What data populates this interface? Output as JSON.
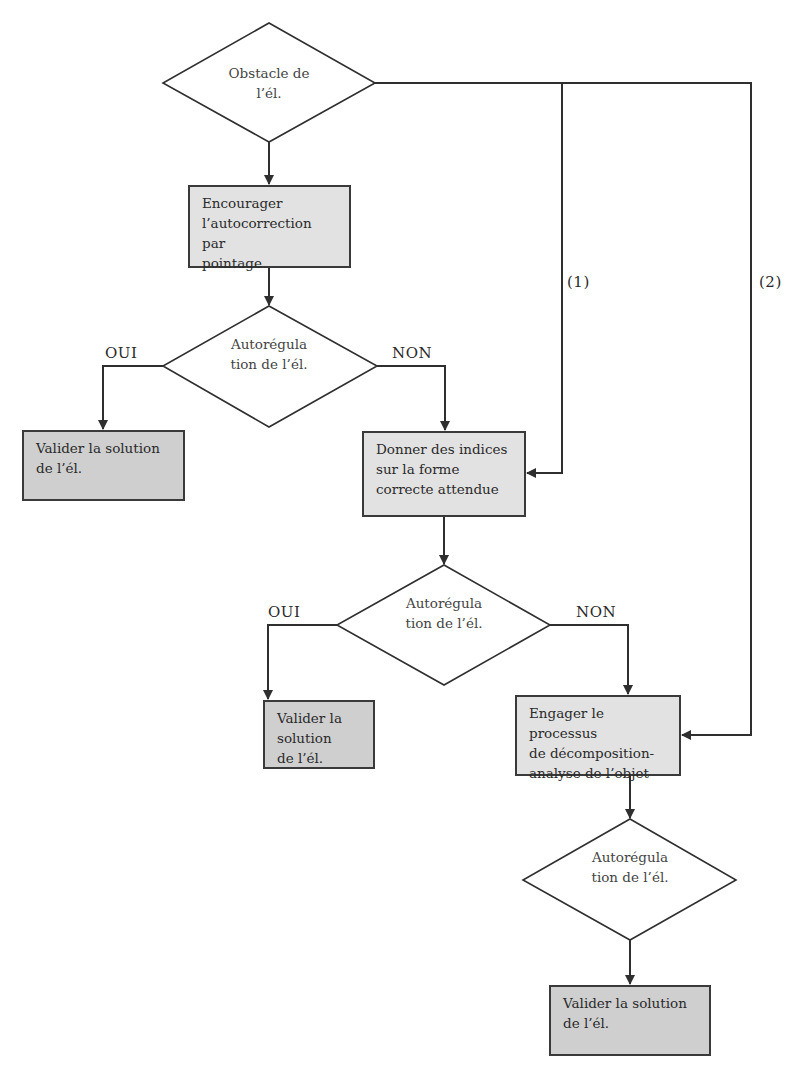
{
  "diagram": {
    "type": "flowchart",
    "nodes": {
      "start": {
        "shape": "diamond",
        "text": "Obstacle de l’él."
      },
      "encourage": {
        "shape": "box",
        "text": "Encourager l’autocorrection par pointage"
      },
      "decision1": {
        "shape": "diamond",
        "text": "Autorégula tion de l’él."
      },
      "validate1": {
        "shape": "box",
        "text": "Valider la solution de l’él."
      },
      "hints": {
        "shape": "box",
        "text": "Donner des indices sur la forme correcte attendue"
      },
      "decision2": {
        "shape": "diamond",
        "text": "Autorégula tion de l’él."
      },
      "validate2": {
        "shape": "box",
        "text": "Valider la solution de l’él."
      },
      "engage": {
        "shape": "box",
        "text": "Engager le processus de décomposition-analyse de l’objet"
      },
      "decision3": {
        "shape": "diamond",
        "text": "Autorégula tion de l’él."
      },
      "validate3": {
        "shape": "box",
        "text": "Valider la solution de l’él."
      }
    },
    "edges": [
      {
        "from": "start",
        "to": "encourage",
        "label": ""
      },
      {
        "from": "start",
        "to": "hints",
        "label": "(1)"
      },
      {
        "from": "start",
        "to": "engage",
        "label": "(2)"
      },
      {
        "from": "encourage",
        "to": "decision1",
        "label": ""
      },
      {
        "from": "decision1",
        "to": "validate1",
        "label": "OUI"
      },
      {
        "from": "decision1",
        "to": "hints",
        "label": "NON"
      },
      {
        "from": "hints",
        "to": "decision2",
        "label": ""
      },
      {
        "from": "decision2",
        "to": "validate2",
        "label": "OUI"
      },
      {
        "from": "decision2",
        "to": "engage",
        "label": "NON"
      },
      {
        "from": "engage",
        "to": "decision3",
        "label": ""
      },
      {
        "from": "decision3",
        "to": "validate3",
        "label": ""
      }
    ],
    "labels": {
      "oui": "OUI",
      "non": "NON",
      "branch1": "(1)",
      "branch2": "(2)"
    },
    "text_lines": {
      "start": [
        "Obstacle de",
        "l’él."
      ],
      "encourage": [
        "Encourager",
        "l’autocorrection par",
        "pointage"
      ],
      "autoreg": [
        "Autorégula",
        "tion de l’él."
      ],
      "validate": [
        "Valider la solution",
        "de l’él."
      ],
      "hints": [
        "Donner des indices",
        "sur la forme",
        "correcte attendue"
      ],
      "engage": [
        "Engager le processus",
        "de décomposition-",
        "analyse de l’objet"
      ]
    },
    "colors": {
      "line": "#2f2f2f",
      "box_fill": "#d9d9d9",
      "box_fill_dark": "#cfcfcf",
      "diamond_fill": "#ffffff"
    }
  }
}
